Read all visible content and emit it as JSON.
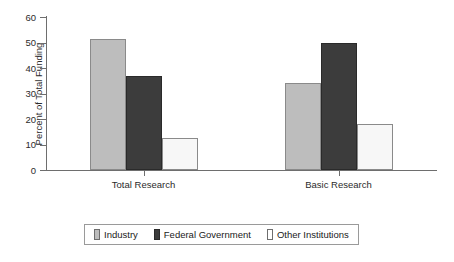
{
  "chart_data": {
    "type": "bar",
    "title": "",
    "subtitle": "",
    "xlabel": "",
    "ylabel": "Percent of Total Funding",
    "categories": [
      "Total Research",
      "Basic Research"
    ],
    "series": [
      {
        "name": "Industry",
        "color": "#bdbdbd",
        "values": [
          51.5,
          34.0
        ]
      },
      {
        "name": "Federal Government",
        "color": "#3c3c3c",
        "values": [
          37.0,
          50.0
        ]
      },
      {
        "name": "Other Institutions",
        "color": "#ffffff",
        "values": [
          12.5,
          18.0
        ]
      }
    ],
    "ylim": [
      0,
      60
    ],
    "yticks": [
      0,
      10,
      20,
      30,
      40,
      50,
      60
    ],
    "ytick_labels": [
      "0",
      "10",
      "20",
      "30",
      "40",
      "50",
      "60"
    ],
    "grid": false,
    "legend_position": "bottom",
    "axis_color": "#6e6e6e"
  }
}
